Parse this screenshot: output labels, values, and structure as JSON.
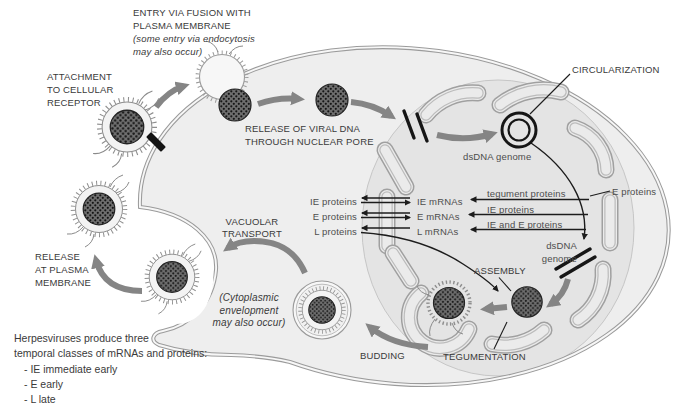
{
  "stages": {
    "entry_l1": "ENTRY VIA FUSION WITH",
    "entry_l2": "PLASMA MEMBRANE",
    "entry_note_l1": "(some entry via endocytosis",
    "entry_note_l2": "may also occur)",
    "attachment_l1": "ATTACHMENT",
    "attachment_l2": "TO CELLULAR",
    "attachment_l3": "RECEPTOR",
    "release_pore_l1": "RELEASE OF VIRAL DNA",
    "release_pore_l2": "THROUGH NUCLEAR PORE",
    "circularization": "CIRCULARIZATION",
    "dsdna_genome_circular": "dsDNA genome",
    "dsdna_genome_linear_l1": "dsDNA",
    "dsdna_genome_linear_l2": "genome",
    "assembly": "ASSEMBLY",
    "tegumentation": "TEGUMENTATION",
    "budding": "BUDDING",
    "cytoplasmic_note_l1": "(Cytoplasmic",
    "cytoplasmic_note_l2": "envelopment",
    "cytoplasmic_note_l3": "may also occur)",
    "vacuolar_l1": "VACUOLAR",
    "vacuolar_l2": "TRANSPORT",
    "release_membrane_l1": "RELEASE",
    "release_membrane_l2": "AT PLASMA",
    "release_membrane_l3": "MEMBRANE"
  },
  "expression": {
    "rows": [
      {
        "protein": "IE proteins",
        "mrna": "IE mRNAs"
      },
      {
        "protein": "E proteins",
        "mrna": "E mRNAs"
      },
      {
        "protein": "L proteins",
        "mrna": "L mRNAs"
      }
    ],
    "regulators": {
      "to_ie": "tegument proteins",
      "to_e": "IE proteins",
      "to_l": "IE and E proteins",
      "source": "E proteins"
    }
  },
  "legend": {
    "l1": "Herpesviruses produce three",
    "l2": "temporal classes of mRNAs and proteins:",
    "items": [
      "- IE immediate early",
      "- E early",
      "- L late"
    ]
  },
  "colors": {
    "cytoplasm": "#eeeeee",
    "nucleus": "#e4e4e4",
    "membrane": "#9b9b9b",
    "thick_arrow": "#858585",
    "ink": "#1c1c1c",
    "label_dark": "#3a3a3a",
    "label_gray": "#4d4d4d"
  }
}
